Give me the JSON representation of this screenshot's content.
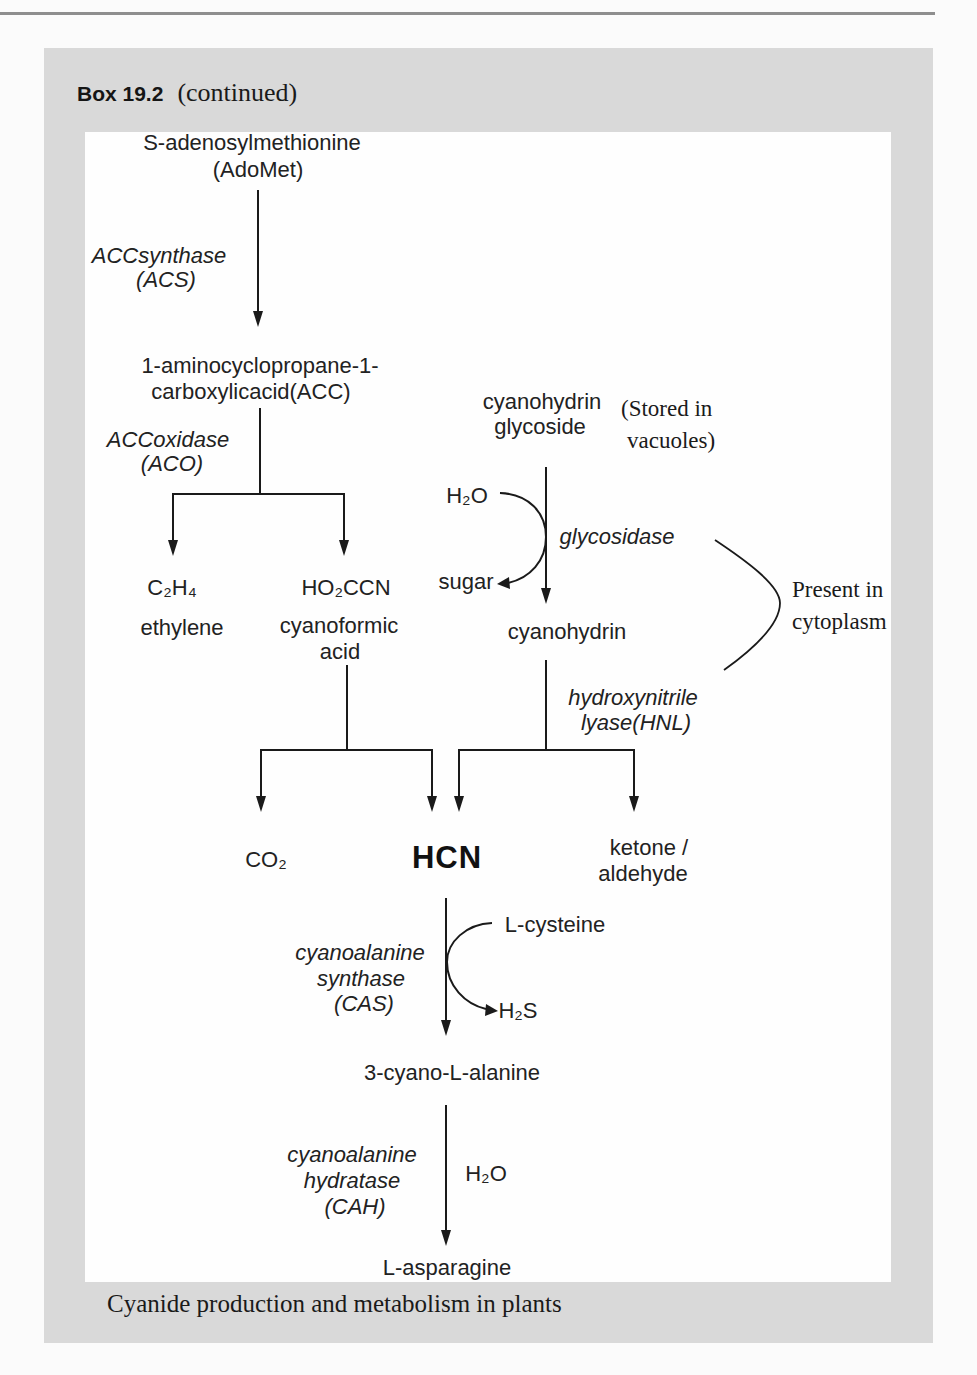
{
  "box": {
    "label": "Box 19.2",
    "status": "(continued)",
    "caption": "Cyanide production and metabolism in plants"
  },
  "diagram": {
    "compounds": {
      "adomet_name": "S-adenosylmethionine",
      "adomet_abbr": "(AdoMet)",
      "acc_line1": "1-aminocyclopropane-1-",
      "acc_line2": "carboxylicacid(ACC)",
      "ethylene_formula": "C₂H₄",
      "ethylene_name": "ethylene",
      "cyanoformic_formula": "HO₂CCN",
      "cyanoformic_line1": "cyanoformic",
      "cyanoformic_line2": "acid",
      "glycoside_line1": "cyanohydrin",
      "glycoside_line2": "glycoside",
      "water_glycosidase": "H₂O",
      "sugar": "sugar",
      "cyanohydrin": "cyanohydrin",
      "co2": "CO₂",
      "hcn": "HCN",
      "ketone_line1": "ketone /",
      "ketone_line2": "aldehyde",
      "l_cysteine": "L-cysteine",
      "h2s": "H₂S",
      "cyanoalanine": "3-cyano-L-alanine",
      "water_cah": "H₂O",
      "asparagine": "L-asparagine"
    },
    "enzymes": {
      "acs": [
        "ACCsynthase",
        "(ACS)"
      ],
      "aco": [
        "ACCoxidase",
        "(ACO)"
      ],
      "glycosidase": "glycosidase",
      "hnl": [
        "hydroxynitrile",
        "lyase(HNL)"
      ],
      "cas": [
        "cyanoalanine",
        "synthase",
        "(CAS)"
      ],
      "cah": [
        "cyanoalanine",
        "hydratase",
        "(CAH)"
      ]
    },
    "annotations": {
      "storage": [
        "(Stored in",
        "vacuoles)"
      ],
      "cytoplasm": [
        "Present in",
        "cytoplasm"
      ]
    },
    "reactions": [
      {
        "from": "S-adenosylmethionine (AdoMet)",
        "to": [
          "1-aminocyclopropane-1-carboxylicacid(ACC)"
        ],
        "enzyme": "ACCsynthase (ACS)"
      },
      {
        "from": "1-aminocyclopropane-1-carboxylicacid(ACC)",
        "to": [
          "C₂H₄ ethylene",
          "HO₂CCN cyanoformic acid"
        ],
        "enzyme": "ACCoxidase (ACO)"
      },
      {
        "from": "HO₂CCN cyanoformic acid",
        "to": [
          "CO₂",
          "HCN"
        ]
      },
      {
        "from": "cyanohydrin glycoside",
        "to": [
          "cyanohydrin"
        ],
        "enzyme": "glycosidase",
        "cosubstrate": "H₂O",
        "coproduct": "sugar"
      },
      {
        "from": "cyanohydrin",
        "to": [
          "HCN",
          "ketone / aldehyde"
        ],
        "enzyme": "hydroxynitrile lyase(HNL)"
      },
      {
        "from": "HCN",
        "to": [
          "3-cyano-L-alanine"
        ],
        "enzyme": "cyanoalanine synthase (CAS)",
        "cosubstrate": "L-cysteine",
        "coproduct": "H₂S"
      },
      {
        "from": "3-cyano-L-alanine",
        "to": [
          "L-asparagine"
        ],
        "enzyme": "cyanoalanine hydratase (CAH)",
        "cosubstrate": "H₂O"
      }
    ]
  },
  "colors": {
    "box_background": "#d9d9d9",
    "panel_background": "#fefefe",
    "rule": "#8e8e8e",
    "ink": "#1c1c1c"
  }
}
